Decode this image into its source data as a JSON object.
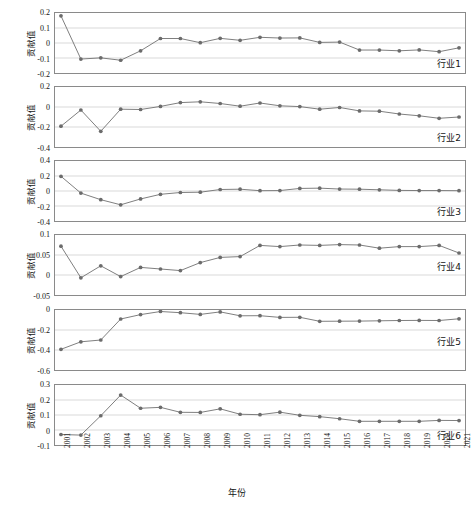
{
  "figure": {
    "xlabel": "年份",
    "ylabel": "贡献值",
    "xtick_labels": [
      "2001",
      "2002",
      "2003",
      "2004",
      "2005",
      "2006",
      "2007",
      "2008",
      "2009",
      "2010",
      "2011",
      "2012",
      "2013",
      "2014",
      "2015",
      "2016",
      "2017",
      "2018",
      "2019",
      "2020",
      "2021"
    ],
    "line_color": "#6e6e6e",
    "marker_color": "#6b6b6b",
    "grid_color": "#d8d8d8",
    "axis_color": "#8a8a8a"
  },
  "chart_data": {
    "type": "line",
    "title": "",
    "xlabel": "年份",
    "ylabel": "贡献值",
    "x": [
      2001,
      2002,
      2003,
      2004,
      2005,
      2006,
      2007,
      2008,
      2009,
      2010,
      2011,
      2012,
      2013,
      2014,
      2015,
      2016,
      2017,
      2018,
      2019,
      2020,
      2021
    ],
    "grid": true,
    "legend_position": "inside-right",
    "panels": [
      {
        "name": "行业1",
        "ylim": [
          -0.2,
          0.2
        ],
        "yticks": [
          0.2,
          0.1,
          0,
          -0.1,
          -0.2
        ],
        "ytick_labels": [
          "0.2",
          "0.1",
          "0",
          "-0.1",
          "-0.2"
        ],
        "values": [
          0.181,
          -0.107,
          -0.099,
          -0.115,
          -0.052,
          0.03,
          0.03,
          0.002,
          0.031,
          0.018,
          0.038,
          0.033,
          0.034,
          0.004,
          0.006,
          -0.047,
          -0.047,
          -0.052,
          -0.046,
          -0.058,
          -0.032
        ]
      },
      {
        "name": "行业2",
        "ylim": [
          -0.4,
          0.2
        ],
        "yticks": [
          0.2,
          0,
          -0.2,
          -0.4
        ],
        "ytick_labels": [
          "0.2",
          "0",
          "-0.2",
          "-0.4"
        ],
        "values": [
          -0.192,
          -0.03,
          -0.243,
          -0.022,
          -0.025,
          0.006,
          0.044,
          0.052,
          0.035,
          0.008,
          0.04,
          0.012,
          0.004,
          -0.022,
          -0.005,
          -0.039,
          -0.042,
          -0.07,
          -0.088,
          -0.113,
          -0.1
        ]
      },
      {
        "name": "行业3",
        "ylim": [
          -0.4,
          0.4
        ],
        "yticks": [
          0.4,
          0.2,
          0,
          -0.2,
          -0.4
        ],
        "ytick_labels": [
          "0.4",
          "0.2",
          "0",
          "-0.2",
          "-0.4"
        ],
        "values": [
          0.196,
          -0.028,
          -0.116,
          -0.184,
          -0.106,
          -0.044,
          -0.02,
          -0.016,
          0.02,
          0.024,
          0.004,
          0.006,
          0.034,
          0.038,
          0.026,
          0.024,
          0.016,
          0.008,
          0.006,
          0.006,
          0.004
        ]
      },
      {
        "name": "行业4",
        "ylim": [
          -0.05,
          0.1
        ],
        "yticks": [
          0.1,
          0.05,
          0,
          -0.05
        ],
        "ytick_labels": [
          "0.1",
          "0.05",
          "0",
          "-0.05"
        ],
        "values": [
          0.072,
          -0.007,
          0.023,
          -0.004,
          0.019,
          0.015,
          0.011,
          0.031,
          0.044,
          0.046,
          0.074,
          0.071,
          0.075,
          0.074,
          0.076,
          0.075,
          0.067,
          0.071,
          0.071,
          0.074,
          0.055
        ]
      },
      {
        "name": "行业5",
        "ylim": [
          -0.6,
          0.0
        ],
        "yticks": [
          0,
          -0.2,
          -0.4,
          -0.6
        ],
        "ytick_labels": [
          "0",
          "-0.2",
          "-0.4",
          "-0.6"
        ],
        "values": [
          -0.393,
          -0.318,
          -0.3,
          -0.09,
          -0.046,
          -0.015,
          -0.027,
          -0.044,
          -0.019,
          -0.058,
          -0.057,
          -0.074,
          -0.073,
          -0.113,
          -0.112,
          -0.111,
          -0.108,
          -0.105,
          -0.104,
          -0.105,
          -0.088
        ]
      },
      {
        "name": "行业6",
        "ylim": [
          -0.1,
          0.3
        ],
        "yticks": [
          0.3,
          0.2,
          0.1,
          0,
          -0.1
        ],
        "ytick_labels": [
          "0.3",
          "0.2",
          "0.1",
          "0",
          "-0.1"
        ],
        "values": [
          -0.03,
          -0.034,
          0.095,
          0.233,
          0.145,
          0.151,
          0.118,
          0.117,
          0.141,
          0.105,
          0.102,
          0.119,
          0.098,
          0.089,
          0.075,
          0.058,
          0.058,
          0.058,
          0.058,
          0.064,
          0.063
        ]
      }
    ]
  }
}
